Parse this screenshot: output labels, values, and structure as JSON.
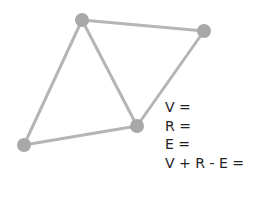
{
  "diagram": {
    "edge_color": "#b5b5b5",
    "vertex_color": "#a8a8a8",
    "vertices": [
      {
        "id": "A",
        "x": 82,
        "y": 20
      },
      {
        "id": "B",
        "x": 204,
        "y": 31
      },
      {
        "id": "C",
        "x": 137,
        "y": 126
      },
      {
        "id": "D",
        "x": 24,
        "y": 145
      }
    ],
    "edges": [
      [
        "A",
        "B"
      ],
      [
        "B",
        "C"
      ],
      [
        "A",
        "C"
      ],
      [
        "A",
        "D"
      ],
      [
        "D",
        "C"
      ]
    ]
  },
  "equations": {
    "vertices_label": "V =",
    "regions_label": "R =",
    "edges_label": "E =",
    "euler_label": "V + R - E ="
  }
}
